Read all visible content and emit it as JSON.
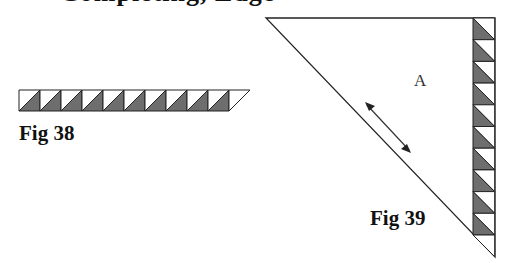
{
  "header": {
    "clipped_text": "Completing, Edge"
  },
  "fig38": {
    "caption": "Fig 38",
    "square_count": 10,
    "colors": {
      "light": "#ffffff",
      "dark": "#6e6e6e",
      "stroke": "#222222"
    }
  },
  "fig39": {
    "caption": "Fig 39",
    "region_label": "A",
    "square_count": 10,
    "arrow": "double-headed grain arrow",
    "colors": {
      "light": "#ffffff",
      "dark": "#6e6e6e",
      "stroke": "#222222"
    }
  }
}
